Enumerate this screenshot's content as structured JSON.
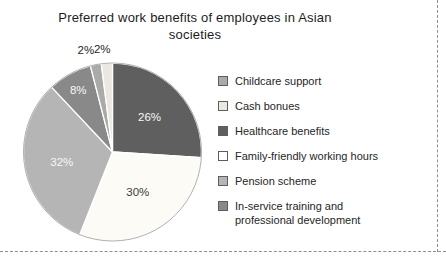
{
  "title": {
    "line1": "Preferred work benefits of employees in Asian",
    "line2": "societies"
  },
  "chart_data": {
    "type": "pie",
    "title": "Preferred work benefits of employees in Asian societies",
    "unit": "%",
    "direction": "clockwise",
    "start_angle": "12-oclock",
    "legend_position": "right",
    "categories": [
      "Childcare support",
      "Cash bonues",
      "Healthcare benefits",
      "Family-friendly working hours",
      "Pension scheme",
      "In-service training and professional development"
    ],
    "values": [
      2,
      2,
      26,
      30,
      32,
      8
    ],
    "slices": [
      {
        "label": "Healthcare benefits",
        "value": 26,
        "color": "#5f5f5f",
        "text_color": "#f7f7f7",
        "label_placement": "inside",
        "label_radius": 0.57
      },
      {
        "label": "Family-friendly working hours",
        "value": 30,
        "color": "#fcfbf5",
        "text_color": "#3c3c3c",
        "label_placement": "inside",
        "label_radius": 0.53
      },
      {
        "label": "Pension scheme",
        "value": 32,
        "color": "#b5b5b5",
        "text_color": "#f7f7f7",
        "label_placement": "inside",
        "label_radius": 0.58
      },
      {
        "label": "In-service training and professional development",
        "value": 8,
        "color": "#898989",
        "text_color": "#f7f7f7",
        "label_placement": "inside",
        "label_radius": 0.8
      },
      {
        "label": "Childcare support",
        "value": 2,
        "color": "#aaaaaa",
        "text_color": "#262626",
        "label_placement": "outside",
        "label_radius": 1.12,
        "label_dx": -8,
        "label_dy": -4
      },
      {
        "label": "Cash bonues",
        "value": 2,
        "color": "#eae8e1",
        "text_color": "#262626",
        "label_placement": "outside",
        "label_radius": 1.12,
        "label_dx": -4,
        "label_dy": -4
      }
    ]
  },
  "legend": {
    "items": [
      {
        "label": "Childcare support",
        "color": "#aaaaaa"
      },
      {
        "label": "Cash bonues",
        "color": "#eae8e1"
      },
      {
        "label": "Healthcare benefits",
        "color": "#5f5f5f"
      },
      {
        "label": "Family-friendly working hours",
        "color": "#ffffff"
      },
      {
        "label": "Pension scheme",
        "color": "#b5b5b5"
      },
      {
        "label": "In-service training and professional development",
        "color": "#898989"
      }
    ]
  },
  "page_borders": {
    "style": "dashed",
    "color": "#8f8f8f"
  }
}
